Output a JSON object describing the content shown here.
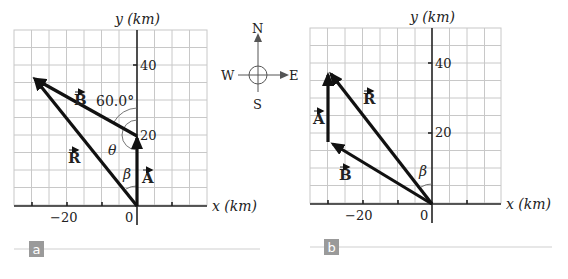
{
  "compass": {
    "north": "N",
    "south": "S",
    "east": "E",
    "west": "W"
  },
  "panels": [
    {
      "id": "a",
      "tag": "a",
      "axes": {
        "xlabel": "x (km)",
        "ylabel": "y (km)"
      },
      "x_ticks": [
        "−20",
        "0"
      ],
      "y_ticks": [
        "20",
        "40"
      ],
      "vectors": {
        "A": "A",
        "B": "B",
        "R": "R"
      },
      "angles": {
        "angle_60": "60.0°",
        "theta": "θ",
        "beta": "β"
      }
    },
    {
      "id": "b",
      "tag": "b",
      "axes": {
        "xlabel": "x (km)",
        "ylabel": "y (km)"
      },
      "x_ticks": [
        "−20",
        "0"
      ],
      "y_ticks": [
        "20",
        "40"
      ],
      "vectors": {
        "A": "A",
        "B": "B",
        "R": "R"
      },
      "angles": {
        "beta": "β"
      }
    }
  ],
  "colors": {
    "grid": "#c8c8c8",
    "ink": "#111111",
    "tag_bg": "#9a9a9a",
    "rule": "#cfcfcf"
  }
}
